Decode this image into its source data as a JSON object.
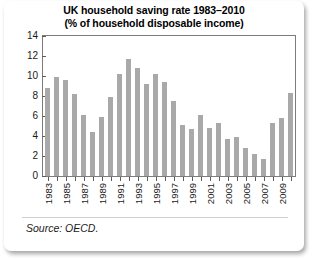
{
  "card": {
    "source_note": "Source: OECD."
  },
  "chart_data": {
    "type": "bar",
    "title": "UK household saving rate 1983–2010",
    "subtitle": "(% of household disposable income)",
    "xlabel": "",
    "ylabel": "",
    "ylim": [
      0,
      14
    ],
    "yticks": [
      0,
      2,
      4,
      6,
      8,
      10,
      12,
      14
    ],
    "ytick_labels": [
      "0",
      "2",
      "4",
      "6",
      "8",
      "10",
      "12",
      "14"
    ],
    "grid": false,
    "legend": "none",
    "categories": [
      "1983",
      "1984",
      "1985",
      "1986",
      "1987",
      "1988",
      "1989",
      "1990",
      "1991",
      "1992",
      "1993",
      "1994",
      "1995",
      "1996",
      "1997",
      "1998",
      "1999",
      "2000",
      "2001",
      "2002",
      "2003",
      "2004",
      "2005",
      "2006",
      "2007",
      "2008",
      "2009",
      "2010"
    ],
    "xtick_labels": [
      "1983",
      "1985",
      "1987",
      "1989",
      "1991",
      "1993",
      "1995",
      "1997",
      "1999",
      "2001",
      "2003",
      "2005",
      "2007",
      "2009"
    ],
    "values": [
      8.8,
      9.9,
      9.6,
      8.2,
      6.1,
      4.4,
      5.9,
      7.9,
      10.2,
      11.7,
      10.8,
      9.2,
      10.2,
      9.4,
      7.5,
      5.1,
      4.7,
      6.1,
      4.8,
      5.3,
      3.7,
      3.9,
      2.8,
      2.2,
      1.7,
      5.3,
      5.8,
      8.3
    ],
    "bar_color": "#a9a9a9",
    "axis_color": "#7c7c7c"
  }
}
